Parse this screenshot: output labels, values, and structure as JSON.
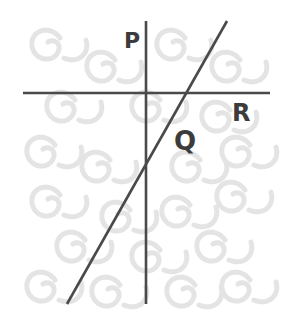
{
  "diagram": {
    "type": "line-intersection",
    "labels": {
      "p": "P",
      "q": "Q",
      "r": "R"
    },
    "lines": [
      {
        "name": "P",
        "orientation": "vertical",
        "x1": 146,
        "y1": 21,
        "x2": 146,
        "y2": 304
      },
      {
        "name": "R",
        "orientation": "horizontal",
        "x1": 23,
        "y1": 93,
        "x2": 270,
        "y2": 93
      },
      {
        "name": "Q",
        "orientation": "diagonal",
        "x1": 227,
        "y1": 21,
        "x2": 67,
        "y2": 304
      }
    ],
    "colors": {
      "line": "#4a4a4a",
      "label": "#3c3c3c",
      "pattern": "#e2e2e2",
      "background": "#ffffff"
    }
  }
}
